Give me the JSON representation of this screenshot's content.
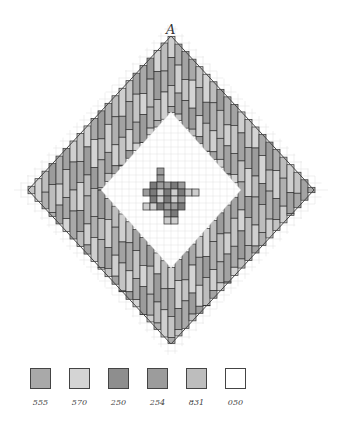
{
  "title_label": "A",
  "grid": {
    "cell": 7,
    "cx": 171,
    "cy": 190,
    "half_w": 143,
    "half_h": 154
  },
  "legend": [
    {
      "code": "555",
      "color": "#a9a9a9"
    },
    {
      "code": "570",
      "color": "#d4d4d4"
    },
    {
      "code": "250",
      "color": "#8e8e8e"
    },
    {
      "code": "254",
      "color": "#9c9c9c"
    },
    {
      "code": "831",
      "color": "#bdbdbd"
    },
    {
      "code": "050",
      "color": "#ffffff"
    }
  ],
  "band_colors": [
    "#c4c4c4",
    "#a9a9a9",
    "#d4d4d4",
    "#9c9c9c",
    "#bdbdbd",
    "#b0b0b0",
    "#cfcfcf",
    "#a3a3a3"
  ],
  "center_colors": {
    "dark": "#7a7a7a",
    "mid": "#9c9c9c",
    "light": "#cdcdcd"
  }
}
